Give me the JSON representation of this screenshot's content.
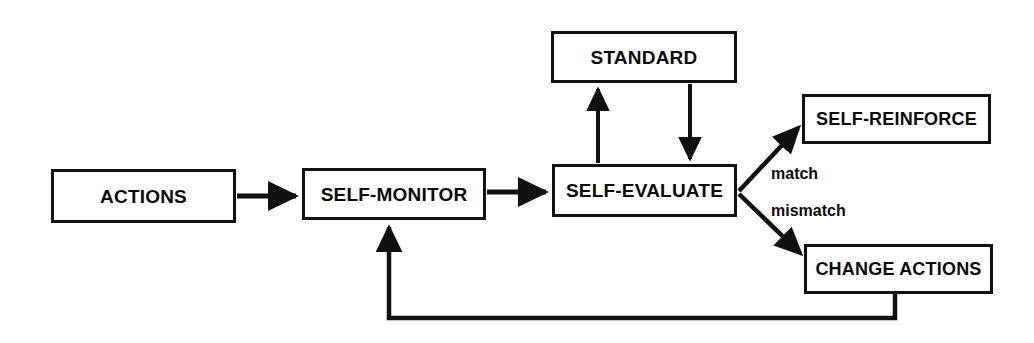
{
  "diagram": {
    "background_color": "#ffffff",
    "line_color": "#111111",
    "text_color": "#0b0b0b",
    "nodes": [
      {
        "id": "standard",
        "label": "STANDARD"
      },
      {
        "id": "actions",
        "label": "ACTIONS"
      },
      {
        "id": "self_monitor",
        "label": "SELF-MONITOR"
      },
      {
        "id": "self_evaluate",
        "label": "SELF-EVALUATE"
      },
      {
        "id": "self_reinforce",
        "label": "SELF-REINFORCE"
      },
      {
        "id": "change_actions",
        "label": "CHANGE ACTIONS"
      }
    ],
    "edge_labels": {
      "match": "match",
      "mismatch": "mismatch"
    },
    "edges": [
      {
        "from": "actions",
        "to": "self_monitor",
        "label": "",
        "style": "straight-arrow"
      },
      {
        "from": "self_monitor",
        "to": "self_evaluate",
        "label": "",
        "style": "straight-arrow"
      },
      {
        "from": "self_evaluate",
        "to": "standard",
        "label": "",
        "style": "vertical-arrow-up"
      },
      {
        "from": "standard",
        "to": "self_evaluate",
        "label": "",
        "style": "vertical-arrow-down"
      },
      {
        "from": "self_evaluate",
        "to": "self_reinforce",
        "label": "match",
        "style": "diagonal-arrow-up"
      },
      {
        "from": "self_evaluate",
        "to": "change_actions",
        "label": "mismatch",
        "style": "diagonal-arrow-down"
      },
      {
        "from": "change_actions",
        "to": "self_monitor",
        "label": "",
        "style": "orthogonal-feedback-arrow"
      }
    ]
  }
}
